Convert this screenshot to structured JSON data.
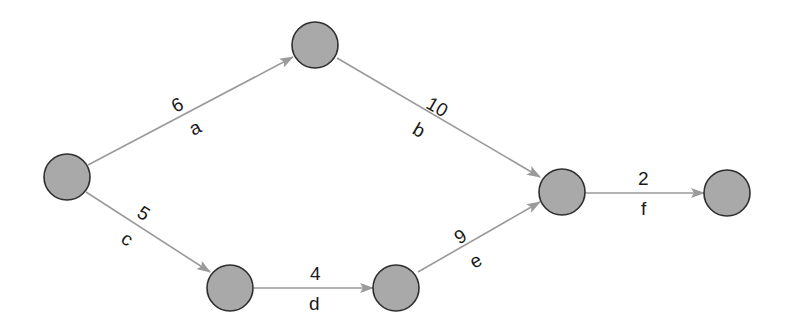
{
  "diagram": {
    "type": "activity-on-arrow network",
    "colors": {
      "node_fill": "#a9a9a9",
      "node_stroke": "#2e2e2e",
      "edge": "#9a9a9a",
      "text": "#1a1a1a"
    },
    "nodes": [
      {
        "id": "n1",
        "x": 67,
        "y": 177
      },
      {
        "id": "n2",
        "x": 315,
        "y": 45
      },
      {
        "id": "n3",
        "x": 230,
        "y": 280
      },
      {
        "id": "n4",
        "x": 397,
        "y": 280
      },
      {
        "id": "n5",
        "x": 562,
        "y": 189
      },
      {
        "id": "n6",
        "x": 728,
        "y": 190
      }
    ],
    "edges": [
      {
        "from": "n1",
        "to": "n2",
        "activity": "a",
        "duration": "6"
      },
      {
        "from": "n2",
        "to": "n5",
        "activity": "b",
        "duration": "10"
      },
      {
        "from": "n1",
        "to": "n3",
        "activity": "c",
        "duration": "5"
      },
      {
        "from": "n3",
        "to": "n4",
        "activity": "d",
        "duration": "4"
      },
      {
        "from": "n4",
        "to": "n5",
        "activity": "e",
        "duration": "9"
      },
      {
        "from": "n5",
        "to": "n6",
        "activity": "f",
        "duration": "2"
      }
    ]
  }
}
